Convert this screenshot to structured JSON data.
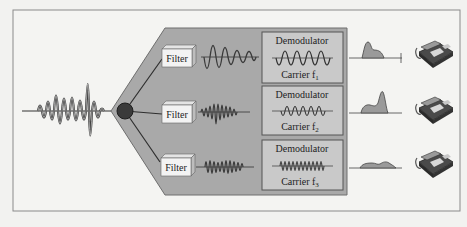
{
  "diagram": {
    "input": {
      "label": "composite-signal"
    },
    "channels": [
      {
        "filter_label": "Filter",
        "demod_label": "Demodulator",
        "carrier_label": "Carrier f",
        "carrier_sub": "1"
      },
      {
        "filter_label": "Filter",
        "demod_label": "Demodulator",
        "carrier_label": "Carrier f",
        "carrier_sub": "2"
      },
      {
        "filter_label": "Filter",
        "demod_label": "Demodulator",
        "carrier_label": "Carrier f",
        "carrier_sub": "3"
      }
    ],
    "colors": {
      "background": "#f2f2f0",
      "frame": "#8a8a8a",
      "panel": "#a9a9a9",
      "panel_edge": "#6e6e6e",
      "demod_box": "#c9c9c9",
      "node": "#3a3a3a",
      "wave": "#3b3b3b",
      "signal_fill": "#9a9a9a"
    }
  }
}
